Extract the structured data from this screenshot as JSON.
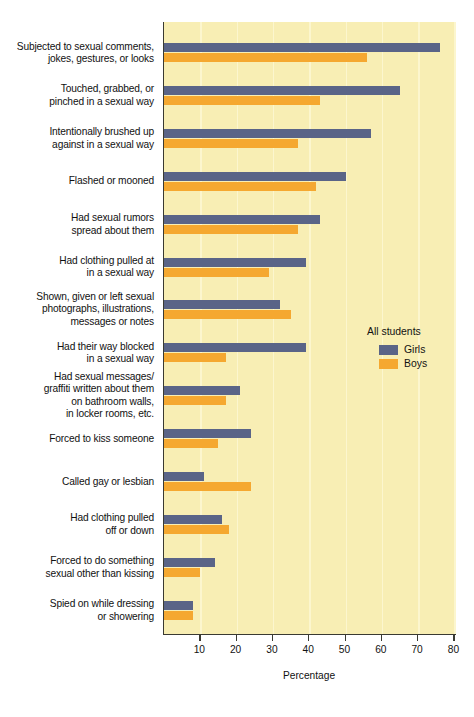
{
  "chart_data": {
    "type": "bar",
    "orientation": "horizontal",
    "title": "",
    "xlabel": "Percentage",
    "ylabel": "",
    "xlim": [
      0,
      80
    ],
    "xticks": [
      10,
      20,
      30,
      40,
      50,
      60,
      70,
      80
    ],
    "grid": "vertical",
    "legend_position": "right-middle",
    "legend_title": "All students",
    "categories": [
      "Subjected to sexual comments, jokes, gestures, or looks",
      "Touched, grabbed, or pinched in a sexual way",
      "Intentionally brushed up against in a sexual way",
      "Flashed or mooned",
      "Had sexual rumors spread about them",
      "Had clothing pulled at in a sexual way",
      "Shown, given or left sexual photographs, illustrations, messages or notes",
      "Had their way blocked in a sexual way",
      "Had sexual messages/ graffiti written about them on bathroom walls, in locker rooms, etc.",
      "Forced to kiss someone",
      "Called gay or lesbian",
      "Had clothing pulled off or down",
      "Forced to do something sexual other than kissing",
      "Spied on while dressing or showering"
    ],
    "category_lines": [
      [
        "Subjected to sexual comments,",
        "jokes, gestures, or looks"
      ],
      [
        "Touched, grabbed, or",
        "pinched in a sexual way"
      ],
      [
        "Intentionally brushed up",
        "against in a sexual way"
      ],
      [
        "Flashed or mooned"
      ],
      [
        "Had sexual rumors",
        "spread about them"
      ],
      [
        "Had clothing pulled at",
        "in a sexual way"
      ],
      [
        "Shown, given or left sexual",
        "photographs, illustrations,",
        "messages or notes"
      ],
      [
        "Had their way blocked",
        "in a sexual way"
      ],
      [
        "Had sexual messages/",
        "graffiti written about them",
        "on bathroom walls,",
        "in locker rooms, etc."
      ],
      [
        "Forced to kiss someone"
      ],
      [
        "Called gay or lesbian"
      ],
      [
        "Had clothing pulled",
        "off or down"
      ],
      [
        "Forced to do something",
        "sexual other than kissing"
      ],
      [
        "Spied on while dressing",
        "or showering"
      ]
    ],
    "series": [
      {
        "name": "Girls",
        "color": "#5a6487",
        "values": [
          76,
          65,
          57,
          50,
          43,
          39,
          32,
          39,
          21,
          24,
          11,
          16,
          14,
          8
        ]
      },
      {
        "name": "Boys",
        "color": "#f5a830",
        "values": [
          56,
          43,
          37,
          42,
          37,
          29,
          35,
          17,
          17,
          15,
          24,
          18,
          10,
          8
        ]
      }
    ],
    "colors": {
      "plot_background": "#f8eeb4",
      "gridline": "#fdf7d2",
      "axis": "#3a3a32",
      "text": "#111111"
    }
  }
}
